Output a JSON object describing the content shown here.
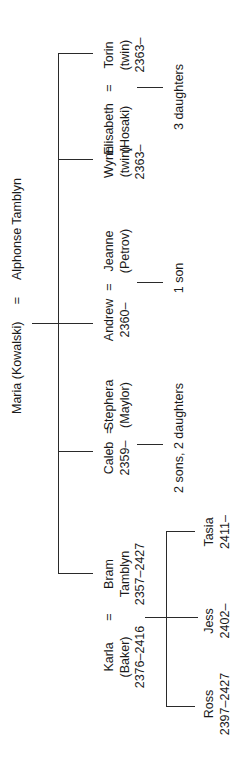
{
  "diagram": {
    "type": "family-tree",
    "orientation": "rotated-90-ccw",
    "root": {
      "spouse_a": "Maria (Kowalski)",
      "marriage_symbol": "=",
      "spouse_b": "Alphonse Tamblyn"
    },
    "children": [
      {
        "name_lines": [
          "Bram",
          "Tamblyn",
          "2357–2427"
        ],
        "spouse_lines": [
          "Karla",
          "(Baker)",
          "2376–2416"
        ],
        "marriage_symbol": "=",
        "offspring": [
          {
            "name": "Ross",
            "dates": "2397–2427"
          },
          {
            "name": "Jess",
            "dates": "2402–"
          },
          {
            "name": "Tasia",
            "dates": "2411–"
          }
        ]
      },
      {
        "name_lines": [
          "Caleb",
          "2359–"
        ],
        "spouse_lines": [
          "Stephera",
          "(Maylor)"
        ],
        "marriage_symbol": "=",
        "offspring_note": "2 sons, 2 daughters"
      },
      {
        "name_lines": [
          "Andrew",
          "2360–"
        ],
        "spouse_lines": [
          "Jeanne",
          "(Petrov)"
        ],
        "marriage_symbol": "=",
        "offspring_note": "1 son"
      },
      {
        "name_lines": [
          "Wynn",
          "(twin)",
          "2363–"
        ]
      },
      {
        "name_lines": [
          "Torin",
          "(twin)",
          "2363–"
        ],
        "spouse_lines": [
          "Elisabeth",
          "(Hosaki)"
        ],
        "marriage_symbol": "=",
        "offspring_note": "3 daughters"
      }
    ]
  },
  "colors": {
    "line": "#2a2a2a",
    "text": "#1a1a1a",
    "background": "#ffffff"
  }
}
